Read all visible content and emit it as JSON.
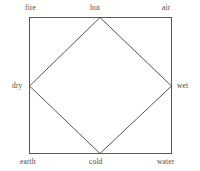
{
  "figure": {
    "type": "four-elements-qualities-diagram",
    "background_color": "#ffffff",
    "stroke_color": "#555555",
    "label_color": "#4a4a4a",
    "outer_square": {
      "name": "elements-square",
      "left": 29,
      "top": 17,
      "right": 172,
      "bottom": 154
    },
    "inner_diamond": {
      "name": "qualities-diamond",
      "top_vertex": {
        "x": 100,
        "y": 17
      },
      "right_vertex": {
        "x": 172,
        "y": 86
      },
      "bottom_vertex": {
        "x": 100,
        "y": 154
      },
      "left_vertex": {
        "x": 29,
        "y": 86
      }
    },
    "labels": {
      "corner_top_left": "fire",
      "corner_top_right": "air",
      "corner_bottom_left": "earth",
      "corner_bottom_right": "water",
      "edge_top": "hot",
      "edge_right": "wet",
      "edge_bottom": "cold",
      "edge_left": "dry"
    }
  }
}
